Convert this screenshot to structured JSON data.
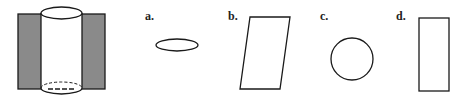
{
  "figure": {
    "colors": {
      "shade": "#8a8a8a",
      "stroke": "#1a1a1a",
      "background": "#ffffff"
    }
  },
  "options": [
    {
      "label": "a.",
      "shape": "ellipse"
    },
    {
      "label": "b.",
      "shape": "parallelogram"
    },
    {
      "label": "c.",
      "shape": "circle"
    },
    {
      "label": "d.",
      "shape": "rectangle"
    }
  ]
}
